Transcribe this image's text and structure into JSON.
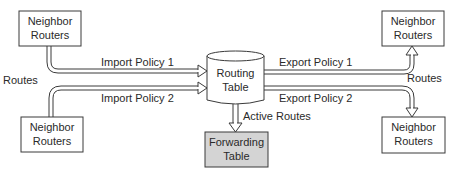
{
  "diagram": {
    "nodes": {
      "neighbor_top_left": {
        "line1": "Neighbor",
        "line2": "Routers"
      },
      "neighbor_bottom_left": {
        "line1": "Neighbor",
        "line2": "Routers"
      },
      "neighbor_top_right": {
        "line1": "Neighbor",
        "line2": "Routers"
      },
      "neighbor_bottom_right": {
        "line1": "Neighbor",
        "line2": "Routers"
      },
      "routing_table": {
        "line1": "Routing",
        "line2": "Table"
      },
      "forwarding_table": {
        "line1": "Forwarding",
        "line2": "Table",
        "fill": "#d4d4d4"
      }
    },
    "edges": {
      "import_policy_1": "Import Policy 1",
      "import_policy_2": "Import Policy 2",
      "export_policy_1": "Export Policy 1",
      "export_policy_2": "Export Policy 2",
      "routes_left": "Routes",
      "routes_right": "Routes",
      "active_routes": "Active Routes"
    }
  }
}
